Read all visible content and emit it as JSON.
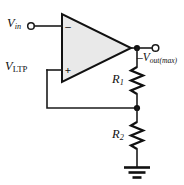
{
  "figure": {
    "name": "inverting-comparator-with-positive-feedback",
    "background_color": "#ffffff",
    "line_color": "#111111",
    "opamp_fill_color": "#e9e9e9"
  },
  "labels": {
    "v_in": {
      "base": "V",
      "sub": "in"
    },
    "v_ltp": {
      "base": "V",
      "sub": "LTP"
    },
    "v_out_max": {
      "prefix": "–",
      "base": "V",
      "sub": "out(max)"
    },
    "r1": {
      "base": "R",
      "sub": "1"
    },
    "r2": {
      "base": "R",
      "sub": "2"
    }
  },
  "opamp": {
    "inverting_input_sign": "–",
    "noninverting_input_sign": "+"
  },
  "components": [
    {
      "name": "op-amp",
      "type": "operational-amplifier"
    },
    {
      "name": "resistor-r1",
      "type": "resistor",
      "label": "R1"
    },
    {
      "name": "resistor-r2",
      "type": "resistor",
      "label": "R2"
    },
    {
      "name": "ground",
      "type": "earth-ground"
    }
  ],
  "terminals": [
    {
      "name": "input-terminal",
      "style": "open-circle",
      "label": "V in"
    },
    {
      "name": "output-terminal",
      "style": "open-circle",
      "label": "-V out(max)"
    }
  ],
  "junctions": [
    {
      "name": "output-node",
      "style": "filled-dot"
    },
    {
      "name": "feedback-divider-node",
      "style": "filled-dot"
    }
  ]
}
